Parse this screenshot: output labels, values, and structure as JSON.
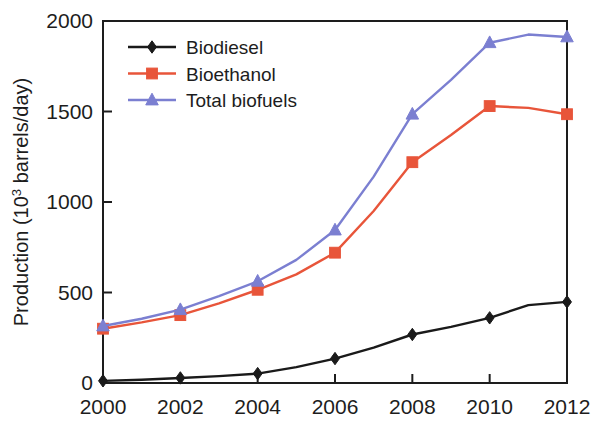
{
  "chart_data": {
    "type": "line",
    "title": "",
    "xlabel": "",
    "ylabel": "Production (10³ barrels/day)",
    "ylabel_prefix": "Production (10",
    "ylabel_sup": "3",
    "ylabel_suffix": " barrels/day)",
    "x": [
      2000,
      2001,
      2002,
      2003,
      2004,
      2005,
      2006,
      2007,
      2008,
      2009,
      2010,
      2011,
      2012
    ],
    "xlim": [
      2000,
      2012
    ],
    "ylim": [
      0,
      2000
    ],
    "xticks": [
      "2000",
      "2002",
      "2004",
      "2006",
      "2008",
      "2010",
      "2012"
    ],
    "xtick_values": [
      2000,
      2002,
      2004,
      2006,
      2008,
      2010,
      2012
    ],
    "yticks": [
      "0",
      "500",
      "1000",
      "1500",
      "2000"
    ],
    "ytick_values": [
      0,
      500,
      1000,
      1500,
      2000
    ],
    "grid": false,
    "legend_position": "top-left-inside",
    "series": [
      {
        "name": "Biodiesel",
        "color": "#1a1a1a",
        "marker": "diamond",
        "x": [
          2000,
          2001,
          2002,
          2003,
          2004,
          2005,
          2006,
          2007,
          2008,
          2009,
          2010,
          2011,
          2012
        ],
        "values": [
          12,
          18,
          28,
          38,
          52,
          88,
          135,
          195,
          268,
          310,
          360,
          430,
          448
        ]
      },
      {
        "name": "Bioethanol",
        "color": "#e8553a",
        "marker": "square",
        "x": [
          2000,
          2001,
          2002,
          2003,
          2004,
          2005,
          2006,
          2007,
          2008,
          2009,
          2010,
          2011,
          2012
        ],
        "values": [
          300,
          335,
          375,
          440,
          515,
          600,
          720,
          950,
          1220,
          1370,
          1530,
          1520,
          1485
        ]
      },
      {
        "name": "Total biofuels",
        "color": "#7b7fd1",
        "marker": "triangle",
        "x": [
          2000,
          2001,
          2002,
          2003,
          2004,
          2005,
          2006,
          2007,
          2008,
          2009,
          2010,
          2011,
          2012
        ],
        "values": [
          315,
          355,
          405,
          480,
          562,
          680,
          845,
          1140,
          1485,
          1675,
          1880,
          1925,
          1912
        ]
      }
    ]
  },
  "legend": {
    "items": [
      {
        "label": "Biodiesel",
        "color": "#1a1a1a",
        "marker": "diamond"
      },
      {
        "label": "Bioethanol",
        "color": "#e8553a",
        "marker": "square"
      },
      {
        "label": "Total biofuels",
        "color": "#7b7fd1",
        "marker": "triangle"
      }
    ]
  },
  "axes": {
    "y_title_prefix": "Production (10",
    "y_title_sup": "3",
    "y_title_suffix": " barrels/day)"
  }
}
